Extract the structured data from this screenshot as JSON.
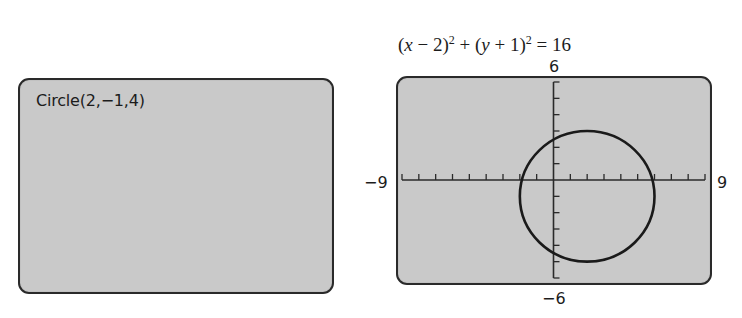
{
  "left_screen": {
    "command": "Circle(2,−1,4)"
  },
  "right_screen": {
    "equation": {
      "part1": "(",
      "x": "x",
      "part2": " − 2)",
      "exp1": "2",
      "part3": " + (",
      "y": "y",
      "part4": " + 1)",
      "exp2": "2",
      "part5": " = 16"
    },
    "window_labels": {
      "ymax": "6",
      "ymin": "−6",
      "xmin": "−9",
      "xmax": "9"
    }
  },
  "chart_data": {
    "type": "line",
    "xlabel": "",
    "ylabel": "",
    "xlim": [
      -9,
      9
    ],
    "ylim": [
      -6,
      6
    ],
    "x_tick_step": 1,
    "y_tick_step": 1,
    "grid": false,
    "series": [
      {
        "name": "Circle(2,−1,4)",
        "shape": "circle",
        "center": [
          2,
          -1
        ],
        "radius": 4,
        "color": "#1a1a1a"
      }
    ],
    "annotations": [
      "6",
      "−6",
      "−9",
      "9"
    ],
    "colors": {
      "screen_bg": "#c9c9c9",
      "border": "#2a2a2a",
      "curve": "#1a1a1a"
    }
  }
}
